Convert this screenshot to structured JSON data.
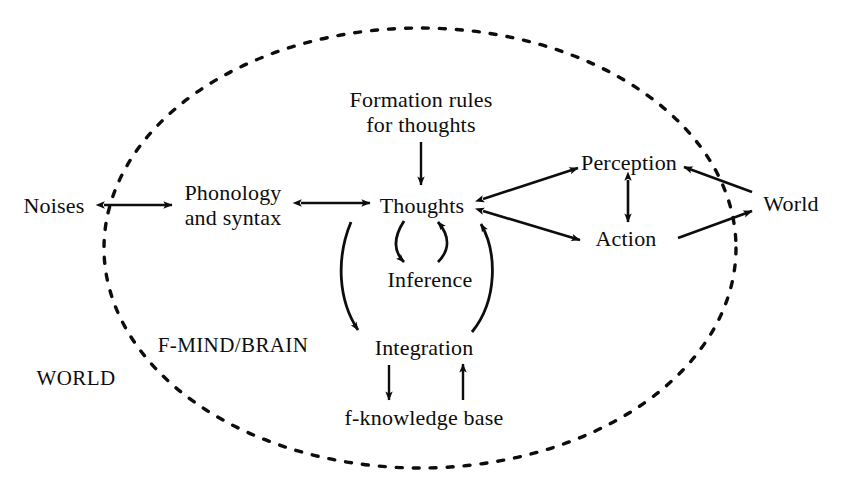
{
  "figure": {
    "type": "diagram",
    "subtype": "concept-flow-diagram",
    "boundary": {
      "name": "dashed-ellipse",
      "style": "dashed",
      "encloses_label": "F-MIND/BRAIN",
      "outside_label": "WORLD"
    },
    "region_labels": [
      {
        "id": "f-mind-brain",
        "text": "F-MIND/BRAIN",
        "x": 233,
        "y": 345
      },
      {
        "id": "world-region",
        "text": "WORLD",
        "x": 76,
        "y": 378
      }
    ],
    "nodes": [
      {
        "id": "noises",
        "text": "Noises",
        "x": 54,
        "y": 205,
        "lines": [
          "Noises"
        ]
      },
      {
        "id": "phonology-syntax",
        "text": "Phonology and syntax",
        "x": 233,
        "y": 205,
        "lines": [
          "Phonology",
          "and syntax"
        ]
      },
      {
        "id": "formation-rules",
        "text": "Formation rules for thoughts",
        "x": 421,
        "y": 112,
        "lines": [
          "Formation rules",
          "for thoughts"
        ]
      },
      {
        "id": "thoughts",
        "text": "Thoughts",
        "x": 422,
        "y": 205,
        "lines": [
          "Thoughts"
        ]
      },
      {
        "id": "inference",
        "text": "Inference",
        "x": 430,
        "y": 279,
        "lines": [
          "Inference"
        ]
      },
      {
        "id": "integration",
        "text": "Integration",
        "x": 424,
        "y": 347,
        "lines": [
          "Integration"
        ]
      },
      {
        "id": "f-knowledge-base",
        "text": "f-knowledge base",
        "x": 424,
        "y": 417,
        "lines": [
          "f-knowledge base"
        ]
      },
      {
        "id": "perception",
        "text": "Perception",
        "x": 629,
        "y": 162,
        "lines": [
          "Perception"
        ]
      },
      {
        "id": "action",
        "text": "Action",
        "x": 626,
        "y": 238,
        "lines": [
          "Action"
        ]
      },
      {
        "id": "world-node",
        "text": "World",
        "x": 791,
        "y": 203,
        "lines": [
          "World"
        ]
      }
    ],
    "edges": [
      {
        "id": "noises-phonology",
        "from": "noises",
        "to": "phonology-syntax",
        "direction": "both",
        "shape": "straight"
      },
      {
        "id": "phonology-thoughts",
        "from": "phonology-syntax",
        "to": "thoughts",
        "direction": "both",
        "shape": "straight"
      },
      {
        "id": "formation-thoughts",
        "from": "formation-rules",
        "to": "thoughts",
        "direction": "forward",
        "shape": "straight"
      },
      {
        "id": "thoughts-inference",
        "from": "thoughts",
        "to": "inference",
        "direction": "forward",
        "shape": "curved"
      },
      {
        "id": "inference-thoughts",
        "from": "inference",
        "to": "thoughts",
        "direction": "forward",
        "shape": "curved"
      },
      {
        "id": "thoughts-integration",
        "from": "thoughts",
        "to": "integration",
        "direction": "forward",
        "shape": "curved"
      },
      {
        "id": "integration-thoughts",
        "from": "integration",
        "to": "thoughts",
        "direction": "forward",
        "shape": "curved"
      },
      {
        "id": "integration-fknowledge",
        "from": "integration",
        "to": "f-knowledge-base",
        "direction": "forward",
        "shape": "straight"
      },
      {
        "id": "fknowledge-integration",
        "from": "f-knowledge-base",
        "to": "integration",
        "direction": "forward",
        "shape": "straight"
      },
      {
        "id": "thoughts-perception",
        "from": "thoughts",
        "to": "perception",
        "direction": "both",
        "shape": "straight"
      },
      {
        "id": "thoughts-action",
        "from": "thoughts",
        "to": "action",
        "direction": "both",
        "shape": "straight"
      },
      {
        "id": "perception-action",
        "from": "perception",
        "to": "action",
        "direction": "both",
        "shape": "straight"
      },
      {
        "id": "world-perception",
        "from": "world-node",
        "to": "perception",
        "direction": "forward",
        "shape": "straight"
      },
      {
        "id": "action-world",
        "from": "action",
        "to": "world-node",
        "direction": "forward",
        "shape": "straight"
      }
    ],
    "colors": {
      "ink": "#0d0d0d",
      "background": "#ffffff"
    }
  }
}
